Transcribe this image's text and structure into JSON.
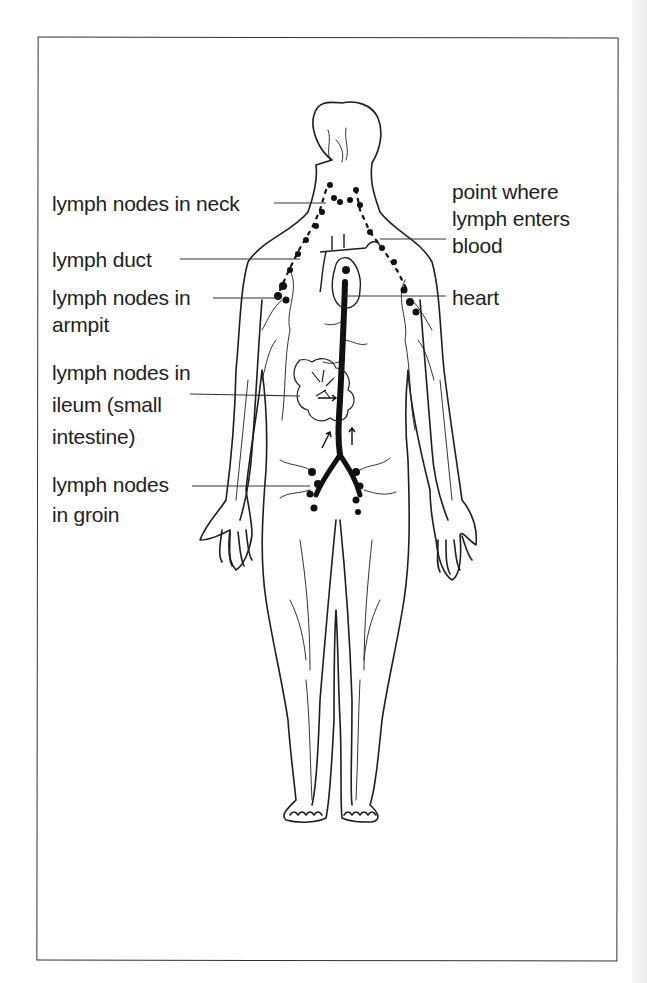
{
  "figure": {
    "labels": {
      "neck": "lymph nodes in neck",
      "entry": [
        "point where",
        "lymph enters",
        "blood"
      ],
      "duct": "lymph duct",
      "heart": "heart",
      "armpit": [
        "lymph nodes in",
        "armpit"
      ],
      "ileum": [
        "lymph nodes in",
        "ileum (small",
        "intestine)"
      ],
      "groin": [
        "lymph nodes",
        "in groin"
      ]
    }
  },
  "colors": {
    "ink": "#1e1e1e",
    "paper": "#ffffff",
    "frame": "#333333"
  }
}
